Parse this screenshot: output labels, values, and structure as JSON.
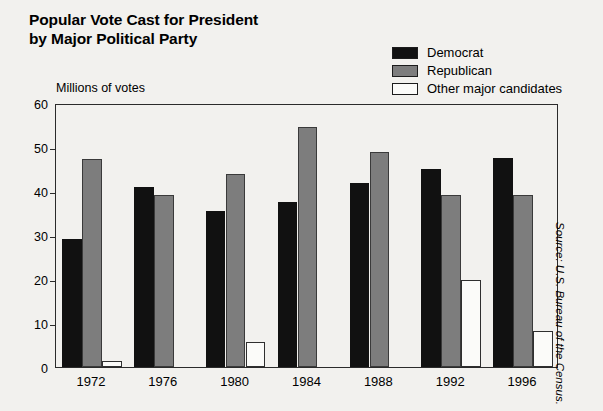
{
  "title": {
    "line1": "Popular Vote Cast for President",
    "line2": "by Major Political Party"
  },
  "axis_caption": "Millions of votes",
  "source_note": "Source: U.S. Bureau of the Census.",
  "colors": {
    "democrat": "#111111",
    "republican": "#7d7d7d",
    "other": "#fbfbf9",
    "frame": "#2b2b2b",
    "background": "#f2f1ee"
  },
  "legend": {
    "items": [
      {
        "label": "Democrat",
        "key": "democrat",
        "swatch": "#111111"
      },
      {
        "label": "Republican",
        "key": "republican",
        "swatch": "#7d7d7d"
      },
      {
        "label": "Other major candidates",
        "key": "other",
        "swatch": "#fbfbf9"
      }
    ]
  },
  "y_axis": {
    "ticks": [
      "0",
      "10",
      "20",
      "30",
      "40",
      "50",
      "60"
    ],
    "min": 0,
    "max": 60,
    "step": 10
  },
  "chart_data": {
    "type": "bar",
    "title": "Popular Vote Cast for President by Major Political Party",
    "subtitle": "",
    "xlabel": "",
    "ylabel": "Millions of votes",
    "ylim": [
      0,
      60
    ],
    "ytick_step": 10,
    "grid": false,
    "legend_position": "top-right",
    "categories": [
      "1972",
      "1976",
      "1980",
      "1984",
      "1988",
      "1992",
      "1996"
    ],
    "series": [
      {
        "name": "Democrat",
        "color": "#111111",
        "values": [
          29.2,
          40.8,
          35.5,
          37.6,
          41.8,
          44.9,
          47.4
        ]
      },
      {
        "name": "Republican",
        "color": "#7d7d7d",
        "values": [
          47.2,
          39.1,
          43.9,
          54.5,
          48.9,
          39.1,
          39.2
        ]
      },
      {
        "name": "Other major candidates",
        "color": "#fbfbf9",
        "values": [
          1.4,
          0,
          5.7,
          0,
          0,
          19.7,
          8.1
        ]
      }
    ],
    "annotations": [
      "Source: U.S. Bureau of the Census."
    ]
  }
}
